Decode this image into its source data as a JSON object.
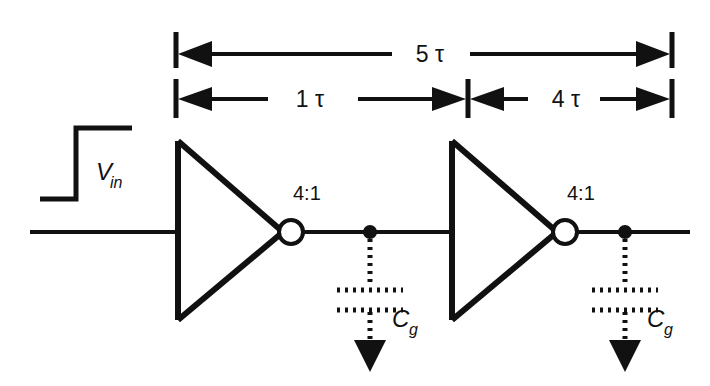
{
  "figure": {
    "background_color": "#ffffff",
    "ink_color": "#111111"
  },
  "dimensions": {
    "total": {
      "label": "5 τ",
      "name": "total-delay-dimension",
      "value": 5,
      "unit": "τ"
    },
    "segments": [
      {
        "label": "1 τ",
        "name": "first-stage-delay-dimension",
        "value": 1,
        "unit": "τ"
      },
      {
        "label": "4 τ",
        "name": "second-stage-delay-dimension",
        "value": 4,
        "unit": "τ"
      }
    ]
  },
  "waveform": {
    "name": "input-step-waveform",
    "label_main": "V",
    "label_sub": "in"
  },
  "stages": [
    {
      "name": "inverter-stage-1",
      "ratio_label": "4:1",
      "cap_main": "C",
      "cap_sub": "g"
    },
    {
      "name": "inverter-stage-2",
      "ratio_label": "4:1",
      "cap_main": "C",
      "cap_sub": "g"
    }
  ]
}
